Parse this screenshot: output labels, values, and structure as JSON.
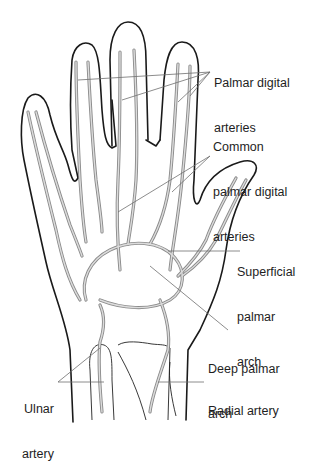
{
  "diagram": {
    "labels": {
      "palmar_digital": {
        "line1": "Palmar digital",
        "line2": "arteries"
      },
      "common_palmar_digital": {
        "line1": "Common",
        "line2": "palmar digital",
        "line3": "arteries"
      },
      "superficial_arch": {
        "line1": "Superficial",
        "line2": "palmar",
        "line3": "arch"
      },
      "deep_arch": {
        "line1": "Deep palmar",
        "line2": "arch"
      },
      "ulnar": {
        "line1": "Ulnar",
        "line2": "artery"
      },
      "radial": {
        "line1": "Radial artery"
      }
    },
    "colors": {
      "outline": "#1a1a1a",
      "artery": "#8a8a8a",
      "artery_fill": "#dcdcdc",
      "leader": "#6f6f6f",
      "text": "#1e1e1e",
      "background": "#ffffff"
    }
  }
}
